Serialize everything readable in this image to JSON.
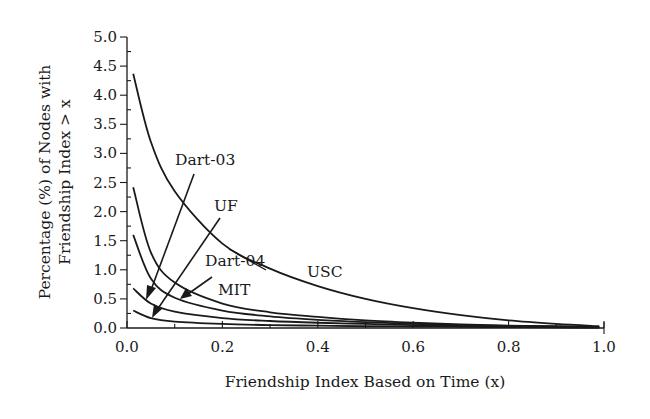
{
  "chart_data": {
    "type": "line",
    "title": "",
    "xlabel": "Friendship Index Based on Time (x)",
    "ylabel_line1": "Percentage (%) of Nodes with",
    "ylabel_line2": "Friendship Index > x",
    "xlim": [
      0.0,
      1.0
    ],
    "ylim": [
      0.0,
      5.0
    ],
    "x_ticks": [
      "0.0",
      "0.2",
      "0.4",
      "0.6",
      "0.8",
      "1.0"
    ],
    "y_ticks": [
      "0.0",
      "0.5",
      "1.0",
      "1.5",
      "2.0",
      "2.5",
      "3.0",
      "3.5",
      "4.0",
      "4.5",
      "5.0"
    ],
    "grid": false,
    "legend": "inline annotations with arrows",
    "x": [
      0.013,
      0.05,
      0.1,
      0.2,
      0.3,
      0.4,
      0.5,
      0.6,
      0.7,
      0.8,
      0.9,
      0.99
    ],
    "series": [
      {
        "name": "USC",
        "values": [
          4.37,
          3.2,
          2.35,
          1.45,
          1.02,
          0.72,
          0.5,
          0.34,
          0.22,
          0.13,
          0.07,
          0.03
        ]
      },
      {
        "name": "Dart-04",
        "values": [
          2.42,
          1.3,
          0.78,
          0.42,
          0.27,
          0.19,
          0.13,
          0.09,
          0.06,
          0.04,
          0.03,
          0.02
        ]
      },
      {
        "name": "MIT",
        "values": [
          1.6,
          0.85,
          0.52,
          0.3,
          0.2,
          0.14,
          0.1,
          0.07,
          0.05,
          0.035,
          0.025,
          0.015
        ]
      },
      {
        "name": "Dart-03",
        "values": [
          0.68,
          0.42,
          0.28,
          0.17,
          0.12,
          0.09,
          0.07,
          0.05,
          0.04,
          0.03,
          0.02,
          0.01
        ]
      },
      {
        "name": "UF",
        "values": [
          0.3,
          0.17,
          0.11,
          0.07,
          0.05,
          0.04,
          0.03,
          0.025,
          0.02,
          0.015,
          0.01,
          0.005
        ]
      }
    ],
    "annotations": [
      {
        "text": "Dart-03",
        "label_x": 0.16,
        "label_y": 2.7
      },
      {
        "text": "UF",
        "label_x": 0.18,
        "label_y": 2.0
      },
      {
        "text": "Dart-04",
        "label_x": 0.16,
        "label_y": 0.95
      },
      {
        "text": "MIT",
        "label_x": 0.19,
        "label_y": 0.55
      },
      {
        "text": "USC",
        "label_x": 0.38,
        "label_y": 0.85
      }
    ]
  }
}
